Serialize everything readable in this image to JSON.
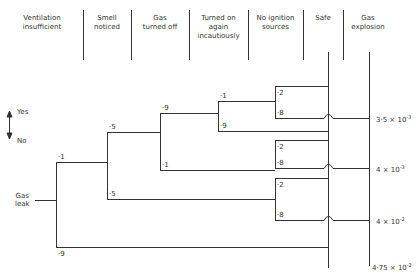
{
  "headers": [
    {
      "label": "Ventilation insufficient",
      "line1": "Ventilation",
      "line2": "insufficient",
      "line3": ""
    },
    {
      "label": "Smell noticed",
      "line1": "Smell",
      "line2": "noticed",
      "line3": ""
    },
    {
      "label": "Gas turned off",
      "line1": "Gas",
      "line2": "turned off",
      "line3": ""
    },
    {
      "label": "Turned on again incautiously",
      "line1": "Turned on",
      "line2": "again",
      "line3": "incautiously"
    },
    {
      "label": "No ignition sources",
      "line1": "No ignition",
      "line2": "sources",
      "line3": ""
    },
    {
      "label": "Safe",
      "line1": "Safe",
      "line2": "",
      "line3": ""
    },
    {
      "label": "Gas explosion",
      "line1": "Gas",
      "line2": "explosion",
      "line3": ""
    }
  ],
  "legend": {
    "yes": "Yes",
    "no": "No"
  },
  "root": {
    "line1": "Gas",
    "line2": "leak"
  },
  "probabilities": {
    "vent_yes": "·1",
    "vent_no": "·9",
    "smell_yes": "·5",
    "smell_no": "·5",
    "off_yes": "·9",
    "off_no": "·1",
    "again_yes": "·1",
    "again_no": "·9",
    "ign_a_yes": "·2",
    "ign_a_no": "·8",
    "ign_b_yes": "·2",
    "ign_b_no": "·8",
    "ign_c_yes": "·2",
    "ign_c_no": "·8"
  },
  "results": [
    {
      "mantissa": "3·5 × 10",
      "exp": "-3"
    },
    {
      "mantissa": "4 × 10",
      "exp": "-3"
    },
    {
      "mantissa": "4 × 10",
      "exp": "-2"
    },
    {
      "mantissa": "4·75 × 10",
      "exp": "-2"
    }
  ]
}
